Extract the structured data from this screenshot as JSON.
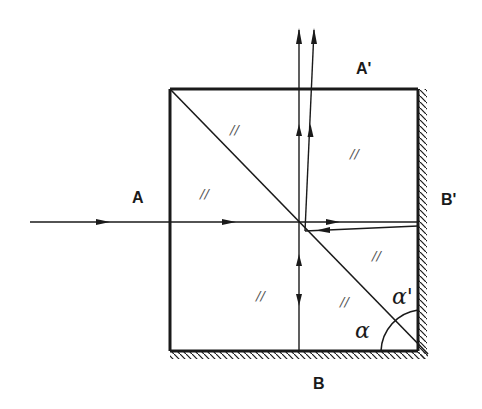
{
  "diagram": {
    "type": "optical-ray-diagram",
    "labels": {
      "input_beam": "A",
      "output_beam": "A'",
      "bottom_mirror": "B",
      "right_mirror": "B'",
      "angle_lower": "α",
      "angle_upper": "α'"
    },
    "glass_marks": [
      "//",
      "//",
      "//",
      "//",
      "//",
      "//"
    ],
    "colors": {
      "line": "#1a1a1a",
      "background": "#ffffff"
    }
  }
}
